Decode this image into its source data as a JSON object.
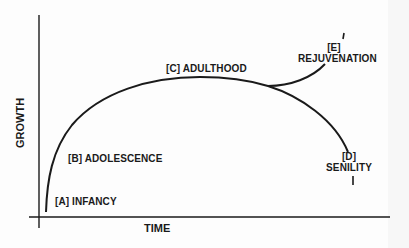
{
  "diagram": {
    "type": "lifecycle-growth-curve",
    "axes": {
      "x_label": "TIME",
      "y_label": "GROWTH"
    },
    "stages": [
      {
        "id": "A",
        "label": "[A] INFANCY"
      },
      {
        "id": "B",
        "label": "[B] ADOLESCENCE"
      },
      {
        "id": "C",
        "label": "[C] ADULTHOOD"
      },
      {
        "id": "D",
        "marker": "[D]",
        "name": "SENILITY"
      },
      {
        "id": "E",
        "marker": "[E]",
        "name": "REJUVENATION"
      }
    ],
    "colors": {
      "ink": "#1a1a1a",
      "background": "#fdfdfd"
    }
  }
}
